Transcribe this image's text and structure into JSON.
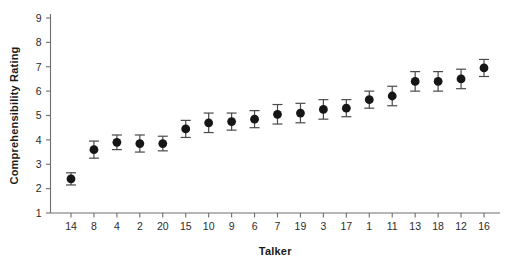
{
  "chart_data": {
    "type": "scatter",
    "title": "",
    "xlabel": "Talker",
    "ylabel": "Comprehensibility Rating",
    "categories": [
      "14",
      "8",
      "4",
      "2",
      "20",
      "15",
      "10",
      "9",
      "6",
      "7",
      "19",
      "3",
      "17",
      "1",
      "11",
      "13",
      "18",
      "12",
      "16"
    ],
    "values": [
      2.4,
      3.6,
      3.9,
      3.85,
      3.85,
      4.45,
      4.7,
      4.75,
      4.85,
      5.05,
      5.1,
      5.25,
      5.3,
      5.65,
      5.8,
      6.4,
      6.4,
      6.5,
      6.95
    ],
    "errors": [
      0.25,
      0.35,
      0.3,
      0.35,
      0.3,
      0.35,
      0.4,
      0.35,
      0.35,
      0.4,
      0.4,
      0.4,
      0.35,
      0.35,
      0.4,
      0.4,
      0.4,
      0.4,
      0.35
    ],
    "error_type": "symmetric error bars",
    "ylim": [
      1,
      9
    ],
    "yticks": [
      1,
      2,
      3,
      4,
      5,
      6,
      7,
      8,
      9
    ],
    "ytick_labels": [
      "1",
      "2",
      "3",
      "4",
      "5",
      "6",
      "7",
      "8",
      "9"
    ],
    "xtick_labels": [
      "14",
      "8",
      "4",
      "2",
      "20",
      "15",
      "10",
      "9",
      "6",
      "7",
      "19",
      "3",
      "17",
      "1",
      "11",
      "13",
      "18",
      "12",
      "16"
    ],
    "grid": false,
    "legend": null,
    "legend_position": "none",
    "marker_color": "#161616",
    "errorbar_color": "#4a4a4a",
    "axis_color": "#6e6e6e",
    "background_color": "#ffffff",
    "annotations": []
  }
}
